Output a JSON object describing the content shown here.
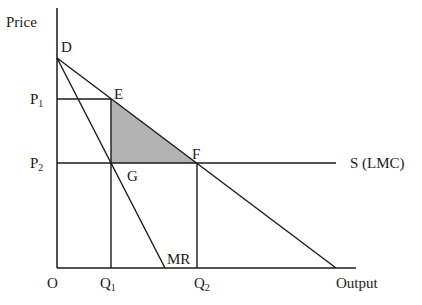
{
  "diagram": {
    "axes": {
      "y_label": "Price",
      "x_label": "Output",
      "origin_label": "O"
    },
    "curves": {
      "demand_label": "D",
      "marginal_revenue_label": "MR",
      "supply_label": "S (LMC)"
    },
    "points": {
      "E": "E",
      "F": "F",
      "G": "G"
    },
    "price_ticks": [
      {
        "main": "P",
        "sub": "1"
      },
      {
        "main": "P",
        "sub": "2"
      }
    ],
    "quantity_ticks": [
      {
        "main": "Q",
        "sub": "1"
      },
      {
        "main": "Q",
        "sub": "2"
      }
    ],
    "shaded_region": {
      "vertices": [
        "E",
        "G",
        "F"
      ],
      "meaning": "deadweight loss",
      "color": "#b3b3b3"
    },
    "line_color": "#1a1a1a"
  }
}
